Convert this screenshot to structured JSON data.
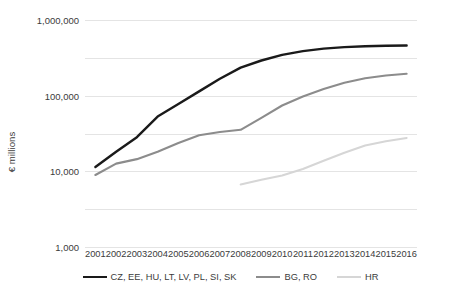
{
  "chart_data": {
    "type": "line",
    "title": "",
    "xlabel": "",
    "ylabel": "€ millions",
    "x": [
      "2001",
      "2002",
      "2003",
      "2004",
      "2005",
      "2006",
      "2007",
      "2008",
      "2009",
      "2010",
      "2011",
      "2012",
      "2013",
      "2014",
      "2015",
      "2016"
    ],
    "yscale": "log",
    "ylim": [
      1,
      1000000
    ],
    "ytick_labels": [
      "1,000,000",
      "100,000",
      "10,000",
      "1,000",
      "100",
      "10",
      "1"
    ],
    "ytick_values": [
      1000000,
      100000,
      10000,
      1000,
      100,
      10,
      1
    ],
    "grid": true,
    "legend_position": "bottom",
    "series": [
      {
        "name": "CZ, EE, HU, LT, LV, PL, SI, SK",
        "color": "#1a1a1a",
        "width": 2.4,
        "values": [
          130,
          330,
          800,
          2800,
          6000,
          13000,
          28000,
          55000,
          85000,
          120000,
          150000,
          175000,
          192000,
          202000,
          208000,
          212000
        ]
      },
      {
        "name": "BG, RO",
        "color": "#8c8c8c",
        "width": 2.1,
        "values": [
          80,
          160,
          210,
          330,
          560,
          900,
          1100,
          1250,
          2600,
          5500,
          9500,
          15000,
          22000,
          29000,
          34000,
          38000
        ]
      },
      {
        "name": "HR",
        "color": "#d6d6d6",
        "width": 2.0,
        "values": [
          null,
          null,
          null,
          null,
          null,
          null,
          null,
          45,
          60,
          78,
          115,
          190,
          310,
          480,
          620,
          760
        ]
      }
    ]
  },
  "axis": {
    "y_title": "€ millions"
  }
}
